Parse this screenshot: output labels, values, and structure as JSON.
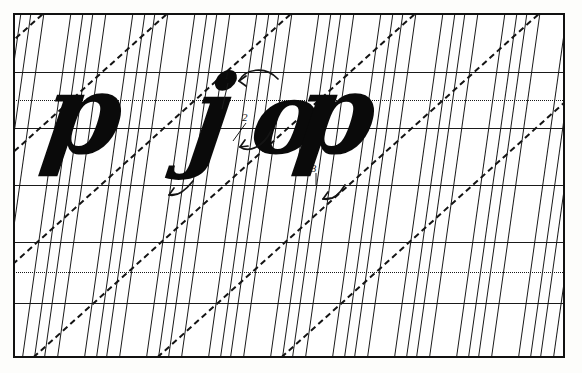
{
  "document": {
    "kind": "calligraphy-practice-sheet",
    "title": "Italic letterform practice grid",
    "background_color": "#ffffff",
    "ink_color": "#0a0a0a",
    "rule_color": "#1a1a1a",
    "frame": {
      "x": 13,
      "y": 13,
      "width": 552,
      "height": 345,
      "border_width": 2
    }
  },
  "grid": {
    "horizontal_rules": [
      {
        "name": "ascender-line-1",
        "y": 72,
        "style": "solid"
      },
      {
        "name": "waist-line-1",
        "y": 100,
        "style": "dotted"
      },
      {
        "name": "base-line-1",
        "y": 128,
        "style": "solid"
      },
      {
        "name": "descender-line-1",
        "y": 185,
        "style": "solid"
      },
      {
        "name": "ascender-line-2",
        "y": 242,
        "style": "solid"
      },
      {
        "name": "waist-line-2",
        "y": 272,
        "style": "dotted"
      },
      {
        "name": "base-line-2",
        "y": 303,
        "style": "solid"
      }
    ],
    "slant_angle_degrees": 8,
    "diagonal_angle_degrees": 48,
    "slant_group_spacing": 62,
    "slant_lines_per_group": 4,
    "note": "Vertical slant guides in repeating groups with 45-degree dashed diagonals"
  },
  "letters": [
    {
      "name": "letter-p-left",
      "char": "p",
      "x": 44,
      "y": 58,
      "size": 112
    },
    {
      "name": "letter-j-middle",
      "char": "j",
      "x": 188,
      "y": 60,
      "size": 112
    },
    {
      "name": "letter-o-right",
      "char": "o",
      "x": 252,
      "y": 68,
      "size": 92
    },
    {
      "name": "letter-p-right",
      "char": "p",
      "x": 296,
      "y": 58,
      "size": 112
    }
  ],
  "stroke_annotations": [
    {
      "name": "stroke-number-1",
      "label": "1",
      "x": 224,
      "y": 70
    },
    {
      "name": "stroke-number-2",
      "label": "2",
      "x": 242,
      "y": 112
    },
    {
      "name": "stroke-number-3",
      "label": "3",
      "x": 311,
      "y": 163
    }
  ],
  "arrows": [
    {
      "name": "arrow-o-entry",
      "description": "curved arrow into top of o"
    },
    {
      "name": "arrow-o-exit",
      "description": "curved arrow at bottom-left of o"
    },
    {
      "name": "arrow-j-tail",
      "description": "arrow at tail of j pointing left"
    },
    {
      "name": "arrow-p-descender",
      "description": "arrow below p descender"
    }
  ]
}
